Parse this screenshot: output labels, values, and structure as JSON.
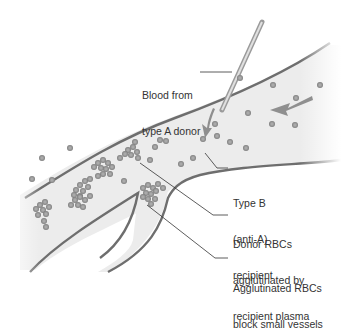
{
  "diagram": {
    "colors": {
      "vessel_fill": "#ebebeb",
      "vessel_wall": "#6e6e6e",
      "rbc": "#9a9a9a",
      "rbc_edge": "#7a7a7a",
      "arrow": "#8f8f8f",
      "leader": "#333333",
      "text": "#333333"
    },
    "labels": [
      {
        "id": "donor",
        "lines": [
          "Blood from",
          "type A donor"
        ]
      },
      {
        "id": "recipient",
        "lines": [
          "Type B",
          "(anti-A)",
          "recipient"
        ]
      },
      {
        "id": "agglutinated",
        "lines": [
          "Donor RBCs",
          "agglutinated by",
          "recipient plasma"
        ]
      },
      {
        "id": "blockage",
        "lines": [
          "Agglutinated RBCs",
          "block small vessels"
        ]
      }
    ],
    "flow_arrow": "arrow-left-icon"
  }
}
